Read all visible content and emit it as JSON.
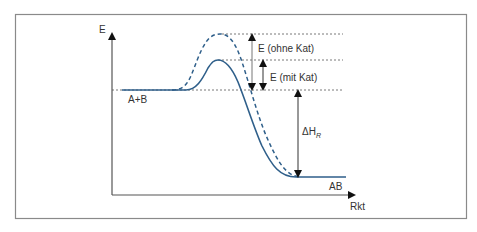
{
  "diagram": {
    "axes": {
      "y_label": "E",
      "x_label": "Rkt"
    },
    "labels": {
      "reactants": "A+B",
      "product": "AB",
      "activation_uncatalyzed": "E (ohne Kat)",
      "activation_catalyzed": "E (mit Kat)",
      "enthalpy_main": "ΔH",
      "enthalpy_sub": "R"
    },
    "curves": [
      {
        "name": "ohne Katalysator",
        "style": "dashed"
      },
      {
        "name": "mit Katalysator",
        "style": "solid"
      }
    ],
    "colors": {
      "curve": "#2f5f8a",
      "axis": "#555555",
      "frame": "#888888",
      "text": "#333333",
      "guide": "#555555"
    }
  }
}
